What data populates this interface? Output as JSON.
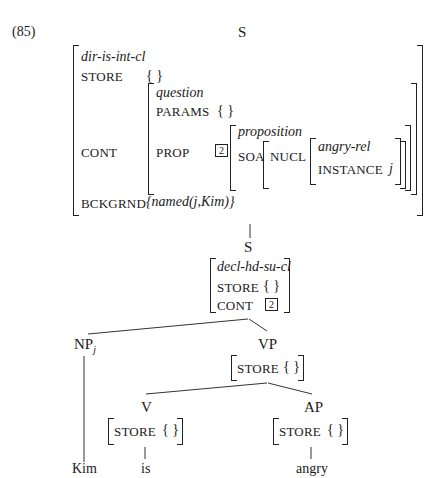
{
  "example_number": "(85)",
  "top_node": {
    "label": "S",
    "avm": {
      "type": "dir-is-int-cl",
      "store_attr": "STORE",
      "store_val": "{ }",
      "cont_attr": "CONT",
      "cont": {
        "type": "question",
        "params_attr": "PARAMS",
        "params_val": "{ }",
        "prop_attr": "PROP",
        "prop_tag": "2",
        "prop": {
          "type": "proposition",
          "soa_attr": "SOA",
          "soa": {
            "nucl_attr": "NUCL",
            "nucl": {
              "type": "angry-rel",
              "instance_attr": "INSTANCE",
              "instance_val": "j"
            }
          }
        }
      },
      "bckgrnd_attr": "BCKGRND",
      "bckgrnd_val": "{named(j,Kim)}"
    }
  },
  "s_node": {
    "label": "S",
    "avm": {
      "type": "decl-hd-su-cl",
      "store_attr": "STORE",
      "store_val": "{ }",
      "cont_attr": "CONT",
      "cont_tag": "2"
    }
  },
  "np_node": {
    "label": "NP",
    "subscript": "j",
    "word": "Kim"
  },
  "vp_node": {
    "label": "VP",
    "store_attr": "STORE",
    "store_val": "{ }"
  },
  "v_node": {
    "label": "V",
    "store_attr": "STORE",
    "store_val": "{ }",
    "word": "is"
  },
  "ap_node": {
    "label": "AP",
    "store_attr": "STORE",
    "store_val": "{ }",
    "word": "angry"
  }
}
